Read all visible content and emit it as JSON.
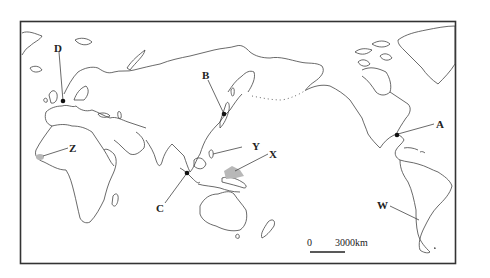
{
  "map": {
    "projection": "Pacific-centered world map",
    "markers": [
      {
        "id": "A",
        "label": "A",
        "type": "point",
        "region": "Gulf of Mexico coast, North America"
      },
      {
        "id": "B",
        "label": "B",
        "type": "point",
        "region": "Japan"
      },
      {
        "id": "C",
        "label": "C",
        "type": "point",
        "region": "Sumatra / Strait of Malacca"
      },
      {
        "id": "D",
        "label": "D",
        "type": "point",
        "region": "Western Europe"
      },
      {
        "id": "W",
        "label": "W",
        "type": "line",
        "region": "Southern Andes, South America"
      },
      {
        "id": "X",
        "label": "X",
        "type": "shaded-area",
        "region": "Western Pacific, east of Philippines"
      },
      {
        "id": "Y",
        "label": "Y",
        "type": "line",
        "region": "Philippines"
      },
      {
        "id": "Z",
        "label": "Z",
        "type": "shaded-area",
        "region": "West Africa coast"
      }
    ],
    "scale_bar": {
      "start_label": "0",
      "end_label": "3000km"
    }
  }
}
